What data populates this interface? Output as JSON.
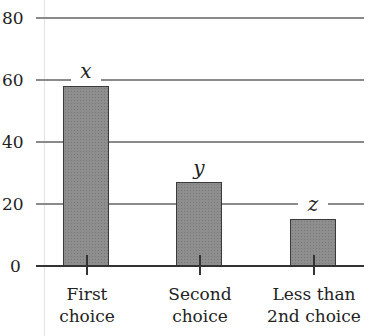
{
  "chart_data": {
    "type": "bar",
    "title": "",
    "xlabel": "",
    "ylabel": "",
    "categories": [
      "First choice",
      "Second choice",
      "Less than 2nd choice"
    ],
    "category_lines": [
      [
        "First",
        "choice"
      ],
      [
        "Second",
        "choice"
      ],
      [
        "Less than",
        "2nd choice"
      ]
    ],
    "values": [
      58,
      27,
      15
    ],
    "bar_labels": [
      "x",
      "y",
      "z"
    ],
    "yticks": [
      0,
      20,
      40,
      60,
      80
    ],
    "ylim": [
      0,
      80
    ],
    "grid": true,
    "legend": null,
    "colors": {
      "bar_fill": "#8e8e8e",
      "bar_edge": "#3a3a3a",
      "grid": "#8a8a8a"
    }
  }
}
